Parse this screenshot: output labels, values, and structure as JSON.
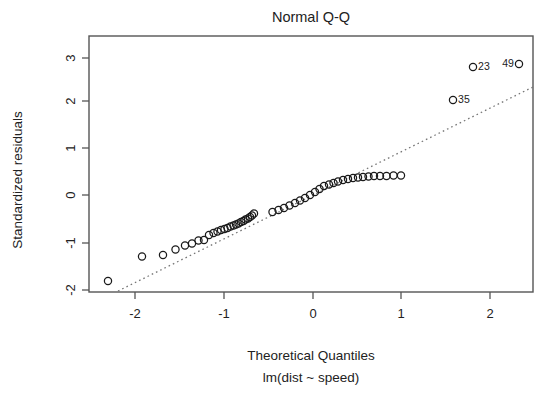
{
  "chart_data": {
    "type": "scatter",
    "title": "Normal Q-Q",
    "xlabel": "Theoretical Quantiles",
    "ylabel": "Standardized residuals",
    "subtitle": "lm(dist ~ speed)",
    "grid": false,
    "legend": "none",
    "xlim": [
      -2.51,
      2.51
    ],
    "ylim": [
      -2.22,
      3.18
    ],
    "xticks": [
      -2,
      -1,
      0,
      1,
      2
    ],
    "xticklabels": [
      "-2",
      "-1",
      "0",
      "1",
      "2"
    ],
    "yticks": [
      -2,
      -1,
      0,
      1,
      2,
      3
    ],
    "yticklabels": [
      "-2",
      "-1",
      "0",
      "1",
      "2",
      "3"
    ],
    "reference_line": {
      "style": "dotted",
      "color": "#777777",
      "x": [
        -2.21,
        2.51
      ],
      "y": [
        -2.22,
        2.34
      ]
    },
    "marker": "open-circle",
    "x": [
      -2.2488,
      -1.8808,
      -1.6449,
      -1.5032,
      -1.3988,
      -1.3151,
      -1.2444,
      -1.1831,
      -1.1288,
      -1.08,
      -1.0356,
      -0.9948,
      -0.957,
      -0.9218,
      -0.8888,
      -0.8577,
      -0.8283,
      -0.8004,
      -0.7737,
      -0.7482,
      -0.7238,
      -0.7002,
      -0.6775,
      -0.6556,
      -0.6344,
      -0.4307,
      -0.3661,
      -0.3043,
      -0.2448,
      -0.1873,
      -0.1314,
      -0.0769,
      -0.0234,
      0.0293,
      0.0813,
      0.1329,
      0.1843,
      0.2357,
      0.2874,
      0.3396,
      0.3926,
      0.4468,
      0.5024,
      0.56,
      0.62,
      0.683,
      0.7494,
      0.8203,
      0.8962,
      0.9787
    ],
    "y": [
      -1.9253,
      -1.3862,
      -1.36,
      -1.242,
      -1.154,
      -1.11,
      -1.052,
      -1.046,
      -0.93,
      -0.893,
      -0.866,
      -0.835,
      -0.816,
      -0.796,
      -0.768,
      -0.741,
      -0.72,
      -0.699,
      -0.674,
      -0.648,
      -0.621,
      -0.593,
      -0.558,
      -0.522,
      -0.488,
      -0.452,
      -0.41,
      -0.366,
      -0.318,
      -0.266,
      -0.213,
      -0.156,
      -0.096,
      -0.033,
      0.032,
      0.098,
      0.125,
      0.16,
      0.195,
      0.221,
      0.245,
      0.26,
      0.27,
      0.278,
      0.283,
      0.287,
      0.29,
      0.292,
      0.294,
      0.296
    ],
    "points_px": [
      [
        108.0,
        281.0
      ],
      [
        142.0,
        256.5
      ],
      [
        163.0,
        255.0
      ],
      [
        175.5,
        249.5
      ],
      [
        185.0,
        245.5
      ],
      [
        192.0,
        243.5
      ],
      [
        198.5,
        240.5
      ],
      [
        204.0,
        240.0
      ],
      [
        209.0,
        235.0
      ],
      [
        213.5,
        233.0
      ],
      [
        217.5,
        231.5
      ],
      [
        221.0,
        230.0
      ],
      [
        224.5,
        229.0
      ],
      [
        227.5,
        228.0
      ],
      [
        230.5,
        226.5
      ],
      [
        233.5,
        225.5
      ],
      [
        236.0,
        224.5
      ],
      [
        238.5,
        223.5
      ],
      [
        241.0,
        222.0
      ],
      [
        243.5,
        221.0
      ],
      [
        245.5,
        219.5
      ],
      [
        248.0,
        218.5
      ],
      [
        250.0,
        217.0
      ],
      [
        252.0,
        215.5
      ],
      [
        254.0,
        213.5
      ],
      [
        272.5,
        212.0
      ],
      [
        278.5,
        210.0
      ],
      [
        284.0,
        208.0
      ],
      [
        289.5,
        205.5
      ],
      [
        295.0,
        203.0
      ],
      [
        300.0,
        200.5
      ],
      [
        305.0,
        198.0
      ],
      [
        310.0,
        195.0
      ],
      [
        315.0,
        192.0
      ],
      [
        319.5,
        189.0
      ],
      [
        324.0,
        186.0
      ],
      [
        329.0,
        184.5
      ],
      [
        333.5,
        183.0
      ],
      [
        338.0,
        181.5
      ],
      [
        343.0,
        180.0
      ],
      [
        348.0,
        179.0
      ],
      [
        353.0,
        178.0
      ],
      [
        358.0,
        177.5
      ],
      [
        363.0,
        177.0
      ],
      [
        368.5,
        176.5
      ],
      [
        374.0,
        176.0
      ],
      [
        380.0,
        176.0
      ],
      [
        386.5,
        176.0
      ],
      [
        393.5,
        175.5
      ],
      [
        401.0,
        175.5
      ]
    ],
    "outliers": [
      {
        "label": "23",
        "x_px": 473.0,
        "y_px": 67.0,
        "label_side": "right",
        "value_x": 1.84,
        "value_y": 2.8
      },
      {
        "label": "49",
        "x_px": 519.0,
        "y_px": 64.0,
        "label_side": "left",
        "value_x": 2.33,
        "value_y": 2.82
      },
      {
        "label": "35",
        "x_px": 453.0,
        "y_px": 100.0,
        "label_side": "right",
        "value_x": 1.58,
        "value_y": 2.04
      }
    ]
  },
  "axes": {
    "title": "Normal Q-Q",
    "x_title": "Theoretical Quantiles",
    "y_title": "Standardized residuals",
    "sub_title": "lm(dist ~ speed)",
    "x_tick_labels": [
      "-2",
      "-1",
      "0",
      "1",
      "2"
    ],
    "y_tick_labels": [
      "3",
      "2",
      "1",
      "0",
      "-1",
      "-2"
    ]
  },
  "colors": {
    "point_stroke": "#1a1a1a",
    "axis": "#555555",
    "reference_line": "#777777",
    "text": "#222222",
    "background": "#ffffff"
  }
}
